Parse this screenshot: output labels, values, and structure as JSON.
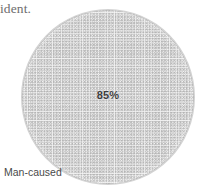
{
  "figure": {
    "caption_fragment": "ident.",
    "background_color": "#ffffff"
  },
  "chart_data": {
    "type": "pie",
    "title": "",
    "subtitle": "",
    "xlabel": "",
    "ylabel": "",
    "categories": [
      "Man-caused"
    ],
    "values": [
      85
    ],
    "value_labels": [
      "85%"
    ],
    "value_unit": "%",
    "slice_colors": [
      "#f0f0f0"
    ],
    "slice_pattern": "stipple-dots",
    "slice_outline_color": "#969696",
    "legend": {
      "visible": false,
      "position": "none"
    },
    "annotations": [
      {
        "text": "85%",
        "placement": "slice-center"
      },
      {
        "text": "Man-caused",
        "placement": "outside-bottom-left"
      }
    ],
    "grid": false,
    "total": 100
  },
  "labels": {
    "category_label": "Man-caused",
    "value_label": "85%"
  }
}
